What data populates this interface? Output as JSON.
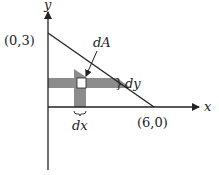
{
  "diagram": {
    "type": "area-element-triangle",
    "axes": {
      "x_label": "x",
      "y_label": "y"
    },
    "points": {
      "y_intercept": "(0,3)",
      "x_intercept": "(6,0)"
    },
    "labels": {
      "area_element": "dA",
      "strip_height": "dy",
      "strip_width": "dx",
      "brace_dy": "}",
      "brace_dx": "⏟"
    },
    "colors": {
      "line": "#222222",
      "strip_fill": "#8c8c8c",
      "element_fill": "#ffffff",
      "background": "#ffffff"
    }
  }
}
